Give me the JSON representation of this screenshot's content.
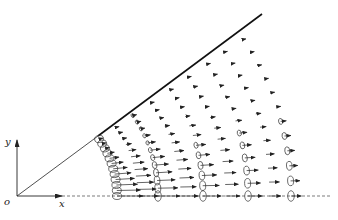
{
  "figure": {
    "labels": {
      "y_axis": "y",
      "x_axis": "x",
      "origin": "o"
    },
    "origin_px": [
      17,
      196
    ],
    "wedge_end_px": [
      262,
      14
    ],
    "arc_radii_px": [
      100,
      141,
      186,
      231,
      274
    ],
    "colors": {
      "ink": "#222222",
      "background": "#ffffff"
    }
  }
}
